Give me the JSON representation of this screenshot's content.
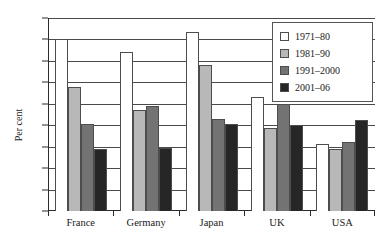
{
  "chart_data": {
    "type": "bar",
    "title": "",
    "subtitle": "",
    "xlabel": "",
    "ylabel": "Per cent",
    "ylim": [
      0,
      4.5
    ],
    "ytick_step": 0.5,
    "yticks": [
      "4.5",
      "4",
      "3.5",
      "3",
      "2.5",
      "2",
      "1.5",
      "1",
      "0.5",
      "0"
    ],
    "grid": true,
    "legend_position": "top-right",
    "categories": [
      "France",
      "Germany",
      "Japan",
      "UK",
      "USA"
    ],
    "series": [
      {
        "name": "1971–80",
        "color": "#ffffff",
        "values": [
          4.0,
          3.7,
          4.17,
          2.67,
          1.57
        ]
      },
      {
        "name": "1981–90",
        "color": "#b8b8b8",
        "values": [
          2.89,
          2.35,
          3.4,
          1.93,
          1.45
        ]
      },
      {
        "name": "1991–2000",
        "color": "#737373",
        "values": [
          2.02,
          2.46,
          2.15,
          2.5,
          1.62
        ]
      },
      {
        "name": "2001–06",
        "color": "#262626",
        "values": [
          1.45,
          1.46,
          2.03,
          2.0,
          2.12
        ]
      }
    ]
  }
}
